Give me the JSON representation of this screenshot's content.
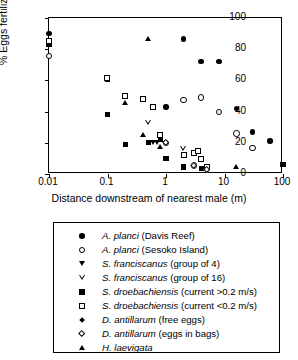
{
  "chart_data": {
    "type": "scatter",
    "title": "",
    "xlabel": "Distance downstream of nearest male (m)",
    "ylabel": "% Eggs fertilized",
    "xscale": "log",
    "xlim": [
      0.01,
      100
    ],
    "ylim": [
      0,
      100
    ],
    "xticks": [
      0.01,
      0.1,
      1,
      10,
      100
    ],
    "xticklabels": [
      "0.01",
      "0.1",
      "1",
      "10",
      "100"
    ],
    "yticks": [
      0,
      20,
      40,
      60,
      80,
      100
    ],
    "yticklabels": [
      "0",
      "20",
      "40",
      "60",
      "80",
      "100"
    ],
    "grid": false,
    "legend_position": "below-axes",
    "series": [
      {
        "name": "A. planci (Davis Reef)",
        "marker": "filled-circle",
        "points": [
          [
            0.01,
            90
          ],
          [
            2,
            86.5
          ],
          [
            4,
            72
          ],
          [
            8,
            72
          ],
          [
            1,
            43
          ],
          [
            16,
            42
          ],
          [
            30,
            27
          ],
          [
            60,
            21
          ],
          [
            100,
            6
          ]
        ]
      },
      {
        "name": "A. planci (Sesoko Island)",
        "marker": "open-circle",
        "points": [
          [
            0.01,
            75.5
          ],
          [
            1,
            20
          ],
          [
            2,
            47.5
          ],
          [
            4,
            49
          ],
          [
            8,
            39.5
          ],
          [
            16,
            26
          ],
          [
            30,
            16.5
          ],
          [
            3,
            5.5
          ],
          [
            5,
            3
          ]
        ]
      },
      {
        "name": "S. franciscanus (group of 4)",
        "marker": "filled-down-triangle",
        "points": [
          [
            0.6,
            20
          ],
          [
            0.7,
            20
          ],
          [
            3,
            13
          ]
        ]
      },
      {
        "name": "S. franciscanus (group of 16)",
        "marker": "open-down-triangle",
        "points": [
          [
            0.5,
            33
          ],
          [
            2,
            16
          ],
          [
            3.5,
            15
          ]
        ]
      },
      {
        "name": "S. droebachiensis (current >0.2 m/s)",
        "marker": "filled-square",
        "points": [
          [
            0.01,
            83
          ],
          [
            0.1,
            60.5
          ],
          [
            0.1,
            38
          ],
          [
            0.2,
            19
          ],
          [
            0.5,
            20
          ],
          [
            0.8,
            22
          ],
          [
            1,
            10
          ],
          [
            2,
            4.5
          ],
          [
            3,
            13.5
          ],
          [
            4,
            3.5
          ],
          [
            5,
            3.5
          ],
          [
            100,
            6
          ]
        ]
      },
      {
        "name": "S. droebachiensis (current <0.2 m/s)",
        "marker": "open-square",
        "points": [
          [
            0.01,
            85
          ],
          [
            0.1,
            61.5
          ],
          [
            0.2,
            50
          ],
          [
            0.4,
            48
          ],
          [
            0.6,
            43
          ],
          [
            0.8,
            25
          ],
          [
            2,
            12
          ],
          [
            3,
            13.5
          ],
          [
            4,
            9.5
          ],
          [
            5,
            4.5
          ],
          [
            3.5,
            15
          ]
        ]
      },
      {
        "name": "D. antillarum (free eggs)",
        "marker": "filled-diamond",
        "points": [
          [
            1,
            43
          ]
        ]
      },
      {
        "name": "D. antillarum (eggs in bags)",
        "marker": "open-diamond",
        "points": [
          [
            1,
            20
          ],
          [
            3,
            5.5
          ],
          [
            5,
            3
          ]
        ]
      },
      {
        "name": "H. laevigata",
        "marker": "filled-up-triangle",
        "points": [
          [
            0.2,
            46
          ],
          [
            0.4,
            25
          ],
          [
            0.5,
            87
          ],
          [
            0.8,
            17.5
          ],
          [
            16,
            4.5
          ]
        ]
      }
    ]
  },
  "axes": {
    "ylabel": "% Eggs fertilized",
    "xlabel": "Distance downstream of nearest male (m)",
    "yticklabels": [
      "0",
      "20",
      "40",
      "60",
      "80",
      "100"
    ],
    "xticklabels": [
      "0.01",
      "0.1",
      "1",
      "10",
      "100"
    ]
  },
  "legend": {
    "items": [
      {
        "marker": "filled-circle",
        "species": "A. planci",
        "detail": " (Davis Reef)"
      },
      {
        "marker": "open-circle",
        "species": "A. planci",
        "detail": " (Sesoko Island)"
      },
      {
        "marker": "filled-down-triangle",
        "species": "S. franciscanus",
        "detail": " (group of 4)"
      },
      {
        "marker": "open-down-triangle",
        "species": "S. franciscanus",
        "detail": " (group of 16)"
      },
      {
        "marker": "filled-square",
        "species": "S. droebachiensis",
        "detail": " (current >0.2 m/s)"
      },
      {
        "marker": "open-square",
        "species": "S. droebachiensis",
        "detail": " (current <0.2 m/s)"
      },
      {
        "marker": "filled-diamond",
        "species": "D. antillarum",
        "detail": " (free eggs)"
      },
      {
        "marker": "open-diamond",
        "species": "D. antillarum",
        "detail": " (eggs in bags)"
      },
      {
        "marker": "filled-up-triangle",
        "species": "H. laevigata",
        "detail": ""
      }
    ]
  }
}
